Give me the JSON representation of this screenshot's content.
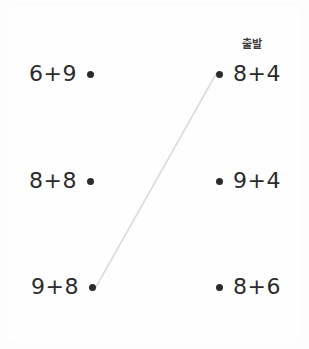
{
  "canvas": {
    "width": 309,
    "height": 349,
    "background": "#fdfdfd"
  },
  "style": {
    "text_color": "#2b2b2b",
    "dot_color": "#2b2b2b",
    "wire_color": "#dcdcdc"
  },
  "matching": {
    "left_column": [
      {
        "expr": "6+9",
        "dot_x": 94,
        "dot_y": 74
      },
      {
        "expr": "8+8",
        "dot_x": 94,
        "dot_y": 181
      },
      {
        "expr": "9+8",
        "dot_x": 96,
        "dot_y": 287
      }
    ],
    "right_column": [
      {
        "expr": "8+4",
        "dot_x": 216,
        "dot_y": 74
      },
      {
        "expr": "9+4",
        "dot_x": 216,
        "dot_y": 181
      },
      {
        "expr": "8+6",
        "dot_x": 216,
        "dot_y": 287
      }
    ],
    "connections": [
      {
        "from_x": 96,
        "from_y": 287,
        "to_x": 216,
        "to_y": 74
      }
    ],
    "labels": [
      {
        "text": "출발",
        "x": 252,
        "y": 43
      }
    ]
  }
}
